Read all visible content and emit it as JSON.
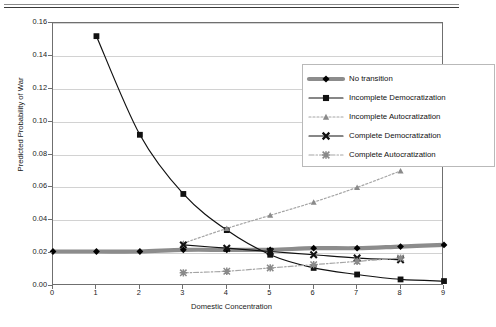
{
  "figure": {
    "has_top_rule": true
  },
  "chart_data": {
    "type": "line",
    "title": "",
    "xlabel": "Domestic Concentration",
    "ylabel": "Predicted Probability of War",
    "xlim": [
      0,
      9
    ],
    "ylim": [
      0,
      0.16
    ],
    "xticks": [
      "0",
      "1",
      "2",
      "3",
      "4",
      "5",
      "6",
      "7",
      "8",
      "9"
    ],
    "xtick_values": [
      0,
      1,
      2,
      3,
      4,
      5,
      6,
      7,
      8,
      9
    ],
    "yticks": [
      "0.00",
      "0.02",
      "0.04",
      "0.06",
      "0.08",
      "0.10",
      "0.12",
      "0.14",
      "0.16"
    ],
    "ytick_values": [
      0,
      0.02,
      0.04,
      0.06,
      0.08,
      0.1,
      0.12,
      0.14,
      0.16
    ],
    "grid": "horizontal",
    "legend_position": "upper-right-inside",
    "series": [
      {
        "name": "No transition",
        "marker": "diamond",
        "linestyle": "solid-thick",
        "color": "#000000",
        "line_color": "#8c8c8c",
        "x": [
          0,
          1,
          2,
          3,
          4,
          5,
          6,
          7,
          8,
          9
        ],
        "values": [
          0.021,
          0.021,
          0.021,
          0.022,
          0.022,
          0.022,
          0.023,
          0.023,
          0.024,
          0.025
        ]
      },
      {
        "name": "Incomplete Democratization",
        "marker": "square",
        "linestyle": "solid",
        "color": "#111111",
        "line_color": "#111111",
        "x": [
          1,
          2,
          3,
          4,
          5,
          6,
          7,
          8,
          9
        ],
        "values": [
          0.152,
          0.092,
          0.056,
          0.034,
          0.019,
          0.011,
          0.007,
          0.004,
          0.003
        ]
      },
      {
        "name": "Incomplete Autocratization",
        "marker": "triangle",
        "linestyle": "dotted",
        "color": "#8a8a8a",
        "line_color": "#a5a5a5",
        "x": [
          3,
          4,
          5,
          6,
          7,
          8
        ],
        "values": [
          0.026,
          0.035,
          0.043,
          0.051,
          0.06,
          0.07
        ]
      },
      {
        "name": "Complete Democratization",
        "marker": "x-cross",
        "linestyle": "solid",
        "color": "#111111",
        "line_color": "#111111",
        "x": [
          3,
          4,
          5,
          6,
          7,
          8
        ],
        "values": [
          0.025,
          0.023,
          0.021,
          0.019,
          0.017,
          0.016
        ]
      },
      {
        "name": "Complete Autocratization",
        "marker": "asterisk",
        "linestyle": "dash-dot",
        "color": "#8a8a8a",
        "line_color": "#a5a5a5",
        "x": [
          3,
          4,
          5,
          6,
          7,
          8
        ],
        "values": [
          0.008,
          0.009,
          0.011,
          0.013,
          0.015,
          0.017
        ]
      }
    ]
  }
}
